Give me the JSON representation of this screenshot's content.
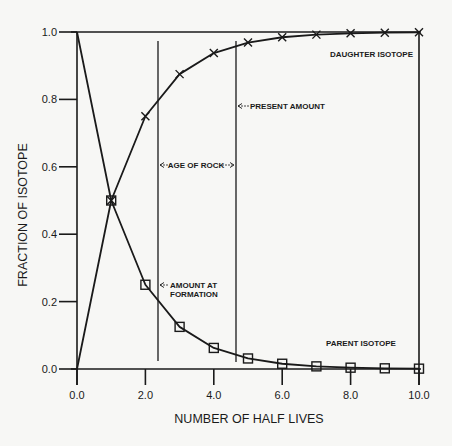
{
  "chart_data": {
    "type": "line",
    "title": "",
    "xlabel": "NUMBER OF HALF LIVES",
    "ylabel": "FRACTION OF ISOTOPE",
    "xlim": [
      0,
      10
    ],
    "ylim": [
      0,
      1.0
    ],
    "x_ticks": [
      "0.0",
      "2.0",
      "4.0",
      "6.0",
      "8.0",
      "10.0"
    ],
    "y_ticks": [
      "0.0",
      "0.2",
      "0.4",
      "0.6",
      "0.8",
      "1.0"
    ],
    "grid": false,
    "x": [
      0,
      1,
      2,
      3,
      4,
      5,
      6,
      7,
      8,
      9,
      10
    ],
    "series": [
      {
        "name": "PARENT ISOTOPE",
        "marker": "square",
        "values": [
          1.0,
          0.5,
          0.25,
          0.125,
          0.0625,
          0.03125,
          0.0156,
          0.0078,
          0.0039,
          0.002,
          0.001
        ]
      },
      {
        "name": "DAUGHTER ISOTOPE",
        "marker": "x",
        "values": [
          0.0,
          0.5,
          0.75,
          0.875,
          0.9375,
          0.96875,
          0.9844,
          0.9922,
          0.9961,
          0.998,
          0.999
        ]
      }
    ],
    "vertical_lines": [
      {
        "x": 2.35,
        "label": "AGE OF ROCK (start)"
      },
      {
        "x": 4.6,
        "label": "PRESENT AMOUNT"
      }
    ],
    "annotations": [
      {
        "text": "AGE OF ROCK",
        "type": "double-arrow"
      },
      {
        "text": "PRESENT AMOUNT",
        "type": "left-arrow"
      },
      {
        "text": "AMOUNT AT",
        "type": "left-arrow"
      },
      {
        "text": "FORMATION",
        "type": "text"
      },
      {
        "text": "DAUGHTER ISOTOPE",
        "type": "series-label"
      },
      {
        "text": "PARENT ISOTOPE",
        "type": "series-label"
      }
    ],
    "legend": "inline labels"
  },
  "labels": {
    "xlabel": "NUMBER OF HALF LIVES",
    "ylabel": "FRACTION OF ISOTOPE",
    "age_of_rock": "AGE OF ROCK",
    "present_amount": "PRESENT AMOUNT",
    "amount_at": "AMOUNT AT",
    "formation": "FORMATION",
    "daughter": "DAUGHTER ISOTOPE",
    "parent": "PARENT ISOTOPE"
  },
  "colors": {
    "background": "#f7f7f5",
    "ink": "#1a1a1a"
  }
}
